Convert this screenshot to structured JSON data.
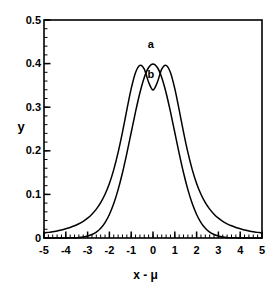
{
  "chart_data": {
    "type": "line",
    "title": "",
    "xlabel": "x - μ",
    "ylabel": "y",
    "xlim": [
      -5,
      5
    ],
    "ylim": [
      0,
      0.5
    ],
    "grid": false,
    "legend_position": "inline-annotations",
    "x_ticks": [
      "-5",
      "-4",
      "-3",
      "-2",
      "-1",
      "0",
      "1",
      "2",
      "3",
      "4",
      "5"
    ],
    "x_tick_values": [
      -5,
      -4,
      -3,
      -2,
      -1,
      0,
      1,
      2,
      3,
      4,
      5
    ],
    "x_minor_tick_interval": 0.2,
    "y_ticks": [
      "0",
      "0.1",
      "0.2",
      "0.3",
      "0.4",
      "0.5"
    ],
    "y_tick_values": [
      0,
      0.1,
      0.2,
      0.3,
      0.4,
      0.5
    ],
    "y_minor_tick_interval": 0.02,
    "annotations": [
      {
        "text": "a",
        "x": -0.1,
        "y": 0.443
      },
      {
        "text": "b",
        "x": -0.1,
        "y": 0.375
      }
    ],
    "series": [
      {
        "name": "a",
        "label": "a",
        "color": "#000000",
        "peak_x": 0,
        "peak_y": 0.399,
        "x": [
          -5,
          -4.8,
          -4.6,
          -4.4,
          -4.2,
          -4,
          -3.8,
          -3.6,
          -3.4,
          -3.2,
          -3,
          -2.8,
          -2.6,
          -2.4,
          -2.2,
          -2,
          -1.8,
          -1.6,
          -1.4,
          -1.2,
          -1,
          -0.8,
          -0.6,
          -0.4,
          -0.2,
          0,
          0.2,
          0.4,
          0.6,
          0.8,
          1,
          1.2,
          1.4,
          1.6,
          1.8,
          2,
          2.2,
          2.4,
          2.6,
          2.8,
          3,
          3.2,
          3.4,
          3.6,
          3.8,
          4,
          4.2,
          4.4,
          4.6,
          4.8,
          5
        ],
        "y": [
          1.5e-06,
          4e-06,
          1e-05,
          2.49e-05,
          5.89e-05,
          0.0001338,
          0.0002919,
          0.0006119,
          0.0012322,
          0.0023841,
          0.0044318,
          0.0079155,
          0.013583,
          0.0223945,
          0.0354746,
          0.053991,
          0.0789502,
          0.1109208,
          0.1497275,
          0.1941861,
          0.2419707,
          0.2896916,
          0.3332246,
          0.3682701,
          0.3910427,
          0.3989423,
          0.3910427,
          0.3682701,
          0.3332246,
          0.2896916,
          0.2419707,
          0.1941861,
          0.1497275,
          0.1109208,
          0.0789502,
          0.053991,
          0.0354746,
          0.0223945,
          0.013583,
          0.0079155,
          0.0044318,
          0.0023841,
          0.0012322,
          0.0006119,
          0.0002919,
          0.0001338,
          5.89e-05,
          2.49e-05,
          1e-05,
          4e-06,
          1.5e-06
        ]
      },
      {
        "name": "b",
        "label": "b",
        "color": "#000000",
        "peak_x": 0,
        "peak_y": 0.3395,
        "x": [
          -5,
          -4.8,
          -4.6,
          -4.4,
          -4.2,
          -4,
          -3.8,
          -3.6,
          -3.4,
          -3.2,
          -3,
          -2.8,
          -2.6,
          -2.4,
          -2.2,
          -2,
          -1.8,
          -1.6,
          -1.4,
          -1.2,
          -1,
          -0.8,
          -0.6,
          -0.4,
          -0.2,
          0,
          0.2,
          0.4,
          0.6,
          0.8,
          1,
          1.2,
          1.4,
          1.6,
          1.8,
          2,
          2.2,
          2.4,
          2.6,
          2.8,
          3,
          3.2,
          3.4,
          3.6,
          3.8,
          4,
          4.2,
          4.4,
          4.6,
          4.8,
          5
        ],
        "y": [
          0.0115,
          0.0129,
          0.0144,
          0.0163,
          0.0184,
          0.0211,
          0.0242,
          0.028,
          0.0326,
          0.0384,
          0.0456,
          0.0547,
          0.0663,
          0.0812,
          0.1004,
          0.1252,
          0.1569,
          0.1963,
          0.2429,
          0.2938,
          0.3425,
          0.3796,
          0.396,
          0.3872,
          0.3572,
          0.3395,
          0.3572,
          0.3872,
          0.396,
          0.3796,
          0.3425,
          0.2938,
          0.2429,
          0.1963,
          0.1569,
          0.1252,
          0.1004,
          0.0812,
          0.0663,
          0.0547,
          0.0456,
          0.0384,
          0.0326,
          0.028,
          0.0242,
          0.0211,
          0.0184,
          0.0163,
          0.0144,
          0.0129,
          0.0115
        ]
      }
    ]
  },
  "axes": {
    "y_label": "y",
    "x_label": "x - μ"
  }
}
